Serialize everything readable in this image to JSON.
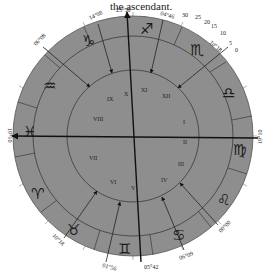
{
  "caption": {
    "lines": [
      "the ascendant.",
      "vered, the",
      "ned"
    ]
  },
  "colors": {
    "wheel_fill": "#8e8e8e",
    "ring_stroke": "#3a3a3a",
    "axis": "#111111",
    "background": "#ffffff"
  },
  "chart": {
    "signs": [
      {
        "name": "capricorn",
        "glyph": "♑"
      },
      {
        "name": "sagittarius",
        "glyph": "♐"
      },
      {
        "name": "scorpio",
        "glyph": "♏"
      },
      {
        "name": "libra",
        "glyph": "♎"
      },
      {
        "name": "virgo",
        "glyph": "♍"
      },
      {
        "name": "leo",
        "glyph": "♌"
      },
      {
        "name": "cancer",
        "glyph": "♋"
      },
      {
        "name": "gemini",
        "glyph": "♊"
      },
      {
        "name": "taurus",
        "glyph": "♉"
      },
      {
        "name": "aries",
        "glyph": "♈"
      },
      {
        "name": "pisces",
        "glyph": "♓"
      },
      {
        "name": "aquarius",
        "glyph": "♒"
      }
    ],
    "cusp_labels": {
      "mc": "25°50",
      "ic": "05°42",
      "asc": "19°10",
      "dsc": "19°10",
      "c11": "04°46",
      "c12": "10°18",
      "c9": "14°08",
      "c8": "06°08",
      "c2": "06°09",
      "c3": "01°56",
      "c5": "10°18",
      "c6": "00°00"
    },
    "scale_marks": [
      "30",
      "25",
      "20",
      "15",
      "10",
      "5",
      "0"
    ],
    "house_numbers": [
      "X",
      "IX",
      "VIII",
      "VII",
      "VI",
      "V",
      "IV",
      "III",
      "II",
      "I",
      "XII",
      "XI"
    ]
  }
}
